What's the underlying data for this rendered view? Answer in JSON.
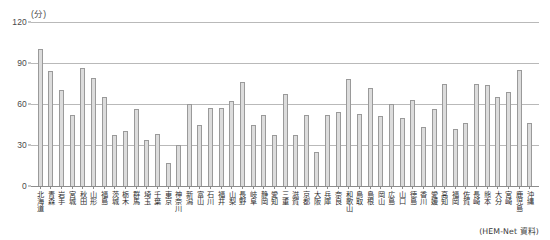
{
  "chart_data": {
    "type": "bar",
    "title": "",
    "subtitle": "",
    "xlabel": "",
    "ylabel": "",
    "unit_label": "(分)",
    "ylim": [
      0,
      120
    ],
    "yticks": [
      0,
      30,
      60,
      90,
      120
    ],
    "grid": true,
    "legend": null,
    "source_note": "(HEM-Net 資料)",
    "categories": [
      "北海道",
      "青森",
      "岩手",
      "宮城",
      "秋田",
      "山形",
      "福島",
      "茨城",
      "栃木",
      "群馬",
      "埼玉",
      "千葉",
      "東京",
      "神奈川",
      "新潟",
      "富山",
      "石川",
      "福井",
      "山梨",
      "長野",
      "岐阜",
      "静岡",
      "愛知",
      "三重",
      "滋賀",
      "京都",
      "大阪",
      "兵庫",
      "奈良",
      "和歌山",
      "鳥取",
      "島根",
      "岡山",
      "広島",
      "山口",
      "徳島",
      "香川",
      "愛媛",
      "高知",
      "福岡",
      "佐賀",
      "長崎",
      "熊本",
      "大分",
      "宮崎",
      "鹿児島",
      "沖縄"
    ],
    "values": [
      100,
      84,
      70,
      52,
      86,
      79,
      65,
      37,
      40,
      56,
      34,
      38,
      17,
      30,
      60,
      45,
      57,
      57,
      62,
      76,
      45,
      52,
      37,
      67,
      37,
      52,
      25,
      52,
      54,
      78,
      53,
      72,
      51,
      60,
      50,
      63,
      43,
      56,
      75,
      42,
      46,
      75,
      74,
      65,
      69,
      85,
      46
    ],
    "colors": {
      "bar_fill": "#dcdcdc",
      "bar_stroke": "#9a9a9a",
      "gridline": "#b9b9b9",
      "axis": "#8d8d8d",
      "text": "#2e2e2e"
    }
  }
}
